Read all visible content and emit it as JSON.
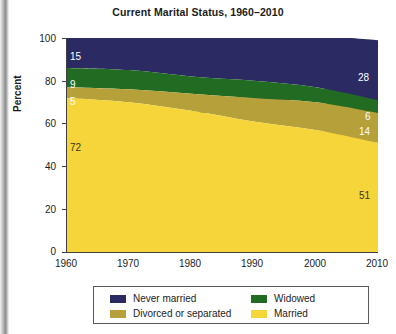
{
  "title": "Current Marital Status, 1960–2010",
  "axes": {
    "y_title": "Percent",
    "y_ticks": [
      "0",
      "20",
      "40",
      "60",
      "80",
      "100"
    ],
    "x_ticks": [
      "1960",
      "1970",
      "1980",
      "1990",
      "2000",
      "2010"
    ]
  },
  "legend": {
    "items": [
      {
        "label": "Never married",
        "color": "#2b2a63"
      },
      {
        "label": "Widowed",
        "color": "#226b22"
      },
      {
        "label": "Divorced or separated",
        "color": "#b5a03a"
      },
      {
        "label": "Married",
        "color": "#f6d53a"
      }
    ]
  },
  "labels": {
    "left": {
      "never_married": "15",
      "widowed": "9",
      "divorced": "5",
      "married": "72"
    },
    "right": {
      "never_married": "28",
      "widowed": "6",
      "divorced": "14",
      "married": "51"
    }
  },
  "chart_data": {
    "type": "area",
    "title": "Current Marital Status, 1960–2010",
    "xlabel": "",
    "ylabel": "Percent",
    "ylim": [
      0,
      100
    ],
    "xlim": [
      1960,
      2010
    ],
    "grid": false,
    "legend_position": "bottom",
    "stacked": true,
    "x": [
      1960,
      1970,
      1980,
      1990,
      2000,
      2010
    ],
    "categories": [
      "1960",
      "1970",
      "1980",
      "1990",
      "2000",
      "2010"
    ],
    "series": [
      {
        "name": "Married",
        "color": "#f6d53a",
        "values": [
          72,
          70,
          66,
          61,
          57,
          51
        ]
      },
      {
        "name": "Divorced or separated",
        "color": "#b5a03a",
        "values": [
          5,
          6,
          8,
          11,
          13,
          14
        ]
      },
      {
        "name": "Widowed",
        "color": "#226b22",
        "values": [
          9,
          9,
          8,
          8,
          7,
          6
        ]
      },
      {
        "name": "Never married",
        "color": "#2b2a63",
        "values": [
          15,
          16,
          18,
          21,
          24,
          28
        ]
      }
    ],
    "annotations": [
      {
        "text": "15",
        "series": "Never married",
        "x": 1960
      },
      {
        "text": "9",
        "series": "Widowed",
        "x": 1960
      },
      {
        "text": "5",
        "series": "Divorced or separated",
        "x": 1960
      },
      {
        "text": "72",
        "series": "Married",
        "x": 1960
      },
      {
        "text": "28",
        "series": "Never married",
        "x": 2010
      },
      {
        "text": "6",
        "series": "Widowed",
        "x": 2010
      },
      {
        "text": "14",
        "series": "Divorced or separated",
        "x": 2010
      },
      {
        "text": "51",
        "series": "Married",
        "x": 2010
      }
    ]
  }
}
